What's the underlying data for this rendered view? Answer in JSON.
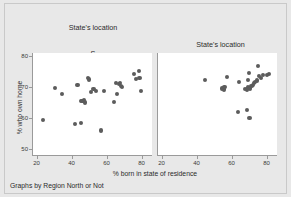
{
  "figure": {
    "background_color": "#e8e8e8",
    "plot_background_color": "#ffffff",
    "marker_color": "#5c5c5c",
    "axis_color": "#9a9a9a",
    "footnote": "Graphs by Region North or Not",
    "xlabel": "% born in state of residence",
    "ylabel": "% who own home"
  },
  "panels": {
    "left": {
      "title_line1": "State's location",
      "title_line2": "S",
      "title_line3": "&",
      "title_line4": "W",
      "title_line5": "Based on Region"
    },
    "right": {
      "title_line1": "State's location",
      "title_line2": "North",
      "title_line3": "Based on Region"
    }
  },
  "chart_data": {
    "type": "scatter",
    "title": "",
    "xlabel": "% born in state of residence",
    "ylabel": "% who own home",
    "xlim": [
      18,
      86
    ],
    "ylim": [
      48,
      81
    ],
    "xticks": [
      20,
      40,
      60,
      80
    ],
    "yticks": [
      50,
      60,
      70,
      80
    ],
    "grid": false,
    "legend": null,
    "note": "Graphs by Region North or Not",
    "panels": [
      {
        "name": "S & W",
        "title": "State's location S & W Based on Region",
        "points": [
          {
            "x": 23.8,
            "y": 59.2
          },
          {
            "x": 30.6,
            "y": 69.6
          },
          {
            "x": 34.6,
            "y": 67.8
          },
          {
            "x": 41.9,
            "y": 58.0
          },
          {
            "x": 43.4,
            "y": 70.6
          },
          {
            "x": 45.3,
            "y": 58.4
          },
          {
            "x": 45.5,
            "y": 65.6
          },
          {
            "x": 46.3,
            "y": 65.5
          },
          {
            "x": 47.1,
            "y": 65.9
          },
          {
            "x": 47.6,
            "y": 65.0
          },
          {
            "x": 49.4,
            "y": 72.9
          },
          {
            "x": 50.2,
            "y": 72.4
          },
          {
            "x": 51.0,
            "y": 68.4
          },
          {
            "x": 52.6,
            "y": 69.4
          },
          {
            "x": 54.2,
            "y": 68.8
          },
          {
            "x": 56.7,
            "y": 55.9
          },
          {
            "x": 58.6,
            "y": 68.7
          },
          {
            "x": 64.3,
            "y": 65.2
          },
          {
            "x": 65.2,
            "y": 71.2
          },
          {
            "x": 66.0,
            "y": 67.8
          },
          {
            "x": 67.3,
            "y": 70.9
          },
          {
            "x": 67.9,
            "y": 71.3
          },
          {
            "x": 68.4,
            "y": 70.2
          },
          {
            "x": 68.8,
            "y": 69.9
          },
          {
            "x": 75.8,
            "y": 74.1
          },
          {
            "x": 77.0,
            "y": 72.5
          },
          {
            "x": 78.6,
            "y": 75.2
          },
          {
            "x": 78.9,
            "y": 73.0
          },
          {
            "x": 79.6,
            "y": 68.8
          }
        ]
      },
      {
        "name": "North",
        "title": "State's location North Based on Region",
        "points": [
          {
            "x": 45.0,
            "y": 72.3
          },
          {
            "x": 54.8,
            "y": 69.5
          },
          {
            "x": 55.6,
            "y": 69.2
          },
          {
            "x": 56.0,
            "y": 70.1
          },
          {
            "x": 57.6,
            "y": 73.2
          },
          {
            "x": 63.6,
            "y": 62.0
          },
          {
            "x": 64.4,
            "y": 71.5
          },
          {
            "x": 67.8,
            "y": 69.4
          },
          {
            "x": 68.7,
            "y": 62.6
          },
          {
            "x": 69.0,
            "y": 69.2
          },
          {
            "x": 69.5,
            "y": 70.0
          },
          {
            "x": 69.6,
            "y": 72.2
          },
          {
            "x": 70.1,
            "y": 74.4
          },
          {
            "x": 70.3,
            "y": 59.9
          },
          {
            "x": 70.8,
            "y": 69.5
          },
          {
            "x": 71.4,
            "y": 70.3
          },
          {
            "x": 72.2,
            "y": 70.6
          },
          {
            "x": 73.0,
            "y": 71.2
          },
          {
            "x": 73.6,
            "y": 71.6
          },
          {
            "x": 74.4,
            "y": 72.1
          },
          {
            "x": 75.3,
            "y": 76.9
          },
          {
            "x": 75.6,
            "y": 73.6
          },
          {
            "x": 77.0,
            "y": 73.0
          },
          {
            "x": 78.2,
            "y": 73.8
          },
          {
            "x": 80.4,
            "y": 74.0
          },
          {
            "x": 81.6,
            "y": 74.2
          }
        ]
      }
    ]
  }
}
